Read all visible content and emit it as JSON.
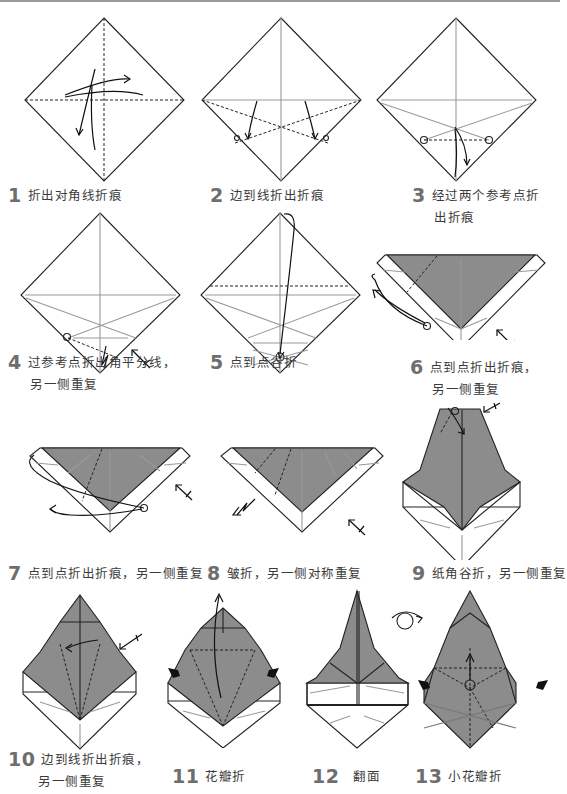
{
  "document": {
    "title": "",
    "colors": {
      "paper_colored_side": "#8c8c8c",
      "paper_white_side": "#ffffff",
      "line": "#222222",
      "crease": "#9a9a9a",
      "step_number": "#6e6e6e"
    }
  },
  "steps": [
    {
      "number": "1",
      "text": "折出对角线折痕",
      "text2": "",
      "icon": "square-diamond-diagonal-creases"
    },
    {
      "number": "2",
      "text": "边到线折出折痕",
      "text2": "",
      "icon": "square-diamond-edge-to-line"
    },
    {
      "number": "3",
      "text": "经过两个参考点折",
      "text2": "出折痕",
      "icon": "square-diamond-reference-points"
    },
    {
      "number": "4",
      "text": "过参考点折出角平分线，",
      "text2": "另一侧重复",
      "icon": "square-diamond-angle-bisector"
    },
    {
      "number": "5",
      "text": "点到点谷折",
      "text2": "",
      "icon": "square-diamond-valley-fold"
    },
    {
      "number": "6",
      "text": "点到点折出折痕，",
      "text2": "另一侧重复",
      "icon": "triangle-colored-crease"
    },
    {
      "number": "7",
      "text": "点到点折出折痕，另一侧重复",
      "text2": "",
      "icon": "triangle-point-to-point"
    },
    {
      "number": "8",
      "text": "皱折，另一侧对称重复",
      "text2": "",
      "icon": "triangle-crimp-fold"
    },
    {
      "number": "9",
      "text": "纸角谷折，另一侧重复",
      "text2": "",
      "icon": "tower-corner-valley-fold"
    },
    {
      "number": "10",
      "text": "边到线折出折痕，",
      "text2": "另一侧重复",
      "icon": "bell-edge-to-line"
    },
    {
      "number": "11",
      "text": "花瓣折",
      "text2": "",
      "icon": "bell-petal-fold"
    },
    {
      "number": "12",
      "text": "翻面",
      "text2": "",
      "icon": "spire-turn-over"
    },
    {
      "number": "13",
      "text": "小花瓣折",
      "text2": "",
      "icon": "spire-small-petal-fold"
    }
  ]
}
